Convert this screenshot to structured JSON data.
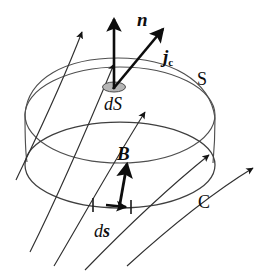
{
  "figure": {
    "canvas": {
      "width": 280,
      "height": 271,
      "background": "#ffffff"
    },
    "ink_color": "#1a1a1a",
    "surface_line_color": "#4a4a4a",
    "patch_fill": "#b3b3b3",
    "labels": {
      "normal_vector": "n",
      "current_density": "j",
      "current_density_subscript": "c",
      "area_element": "dS",
      "surface": "S",
      "field_vector": "B",
      "boundary_curve": "C",
      "line_element_prefix": "d",
      "line_element_vector": "s"
    },
    "geometry": {
      "dome_rim_center_x": 120,
      "dome_rim_center_y": 115,
      "dome_rim_rx": 95,
      "dome_rim_ry": 48,
      "boundary_center_x": 120,
      "boundary_center_y": 165,
      "boundary_rx": 95,
      "boundary_ry": 43,
      "patch_center_x": 114,
      "patch_center_y": 87,
      "patch_rx": 11,
      "patch_ry": 5
    },
    "field_lines": [
      {
        "name": "field-line-1",
        "path": "M 18,176 C 40,130 62,82 85,26",
        "arrow_at": [
          85,
          26
        ],
        "arrow_angle": -64
      },
      {
        "name": "field-line-2",
        "path": "M 32,248 C 60,192 88,130 118,58",
        "arrow_at": [
          118,
          58
        ],
        "arrow_angle": -68
      },
      {
        "name": "field-line-3",
        "path": "M 55,262 C 82,215 112,162 148,106",
        "arrow_at": [
          148,
          106
        ],
        "arrow_angle": -58
      },
      {
        "name": "field-line-4",
        "path": "M 86,268 C 120,232 160,190 214,150",
        "arrow_at": [
          214,
          150
        ],
        "arrow_angle": -38
      },
      {
        "name": "field-line-5",
        "path": "M 128,262 C 162,230 206,192 258,162",
        "arrow_at": [
          258,
          162
        ],
        "arrow_angle": -32
      }
    ],
    "vectors": {
      "n_arrow": {
        "from": [
          114,
          88
        ],
        "to": [
          114,
          18
        ]
      },
      "jc_arrow": {
        "from": [
          114,
          88
        ],
        "to": [
          164,
          28
        ]
      },
      "B_arrow": {
        "from": [
          120,
          208
        ],
        "to": [
          127,
          163
        ]
      },
      "ds_arrow": {
        "from": [
          104,
          205
        ],
        "to": [
          126,
          207
        ]
      }
    },
    "tick_marks": [
      {
        "name": "tick-left",
        "x": 93,
        "y": 204
      },
      {
        "name": "tick-right",
        "x": 132,
        "y": 206
      }
    ]
  }
}
